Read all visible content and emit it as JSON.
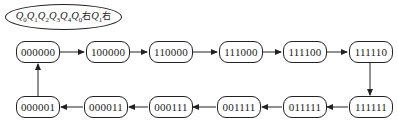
{
  "title": {
    "parts": [
      {
        "q": "Q",
        "sub": "0"
      },
      {
        "q": "Q",
        "sub": "1"
      },
      {
        "q": "Q",
        "sub": "2"
      },
      {
        "q": "Q",
        "sub": "3"
      },
      {
        "q": "Q",
        "sub": "4"
      },
      {
        "q": "Q",
        "sub": "0"
      }
    ],
    "suffix1": "右",
    "mid_q": "Q",
    "mid_sub": "1",
    "suffix2": "右"
  },
  "states": {
    "top": [
      "000000",
      "100000",
      "110000",
      "111000",
      "111100",
      "111110"
    ],
    "bottom": [
      "000001",
      "000011",
      "000111",
      "001111",
      "011111",
      "111111"
    ]
  },
  "sequence": [
    "000000",
    "100000",
    "110000",
    "111000",
    "111100",
    "111110",
    "111111",
    "011111",
    "001111",
    "000111",
    "000011",
    "000001",
    "000000"
  ]
}
